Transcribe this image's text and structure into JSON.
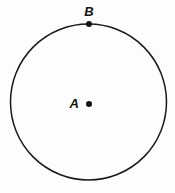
{
  "figure": {
    "background_color": "#fdfdfd",
    "stroke_color": "#1a1a1a",
    "label_color": "#141414",
    "width": 175,
    "height": 193
  },
  "circle": {
    "name": "circle",
    "center_x": 88.5,
    "center_y": 102,
    "radius": 78,
    "stroke_width": 1.5
  },
  "points": [
    {
      "label": "A",
      "role": "center",
      "x": 89,
      "y": 104,
      "dot_radius": 3,
      "label_x": 79,
      "label_y": 108
    },
    {
      "label": "B",
      "role": "on-circumference",
      "x": 89,
      "y": 24,
      "dot_radius": 3,
      "label_x": 89,
      "label_y": 16
    }
  ]
}
